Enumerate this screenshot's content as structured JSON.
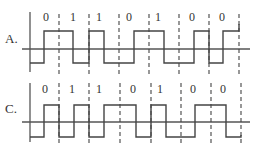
{
  "diagrams": [
    {
      "id": "A",
      "label": "A.",
      "bits": [
        "0",
        "1",
        "1",
        "0",
        "1",
        "0",
        "0"
      ],
      "geometry": {
        "label_x": 5,
        "label_y": 43,
        "axis_x": 30,
        "axis_top": 12,
        "axis_bottom": 72,
        "baseline_y": 49,
        "baseline_x1": 22,
        "baseline_x2": 250,
        "high_y": 31,
        "low_y": 63,
        "digit_y": 21,
        "dash_top": 14,
        "dash_bottom": 75
      },
      "dash_x": [
        59,
        89,
        119,
        149,
        179,
        209,
        239
      ],
      "digit_x": [
        46,
        73,
        99,
        129,
        158,
        192,
        222
      ],
      "waveform": [
        [
          30,
          "L"
        ],
        [
          44,
          "H"
        ],
        [
          73,
          "L"
        ],
        [
          89,
          "H"
        ],
        [
          104,
          "L"
        ],
        [
          134,
          "H"
        ],
        [
          164,
          "L"
        ],
        [
          194,
          "H"
        ],
        [
          209,
          "L"
        ],
        [
          223,
          "H"
        ],
        [
          239,
          "T"
        ]
      ],
      "end_tick_y": 24
    },
    {
      "id": "C",
      "label": "C.",
      "bits": [
        "0",
        "1",
        "1",
        "0",
        "1",
        "0",
        "0"
      ],
      "geometry": {
        "label_x": 5,
        "label_y": 113,
        "axis_x": 30,
        "axis_top": 83,
        "axis_bottom": 142,
        "baseline_y": 122,
        "baseline_x1": 22,
        "baseline_x2": 250,
        "high_y": 105,
        "low_y": 137,
        "digit_y": 93,
        "dash_top": 83,
        "dash_bottom": 143
      },
      "dash_x": [
        59,
        89,
        120,
        151,
        181,
        211,
        241
      ],
      "digit_x": [
        45,
        72,
        99,
        133,
        160,
        193,
        223
      ],
      "waveform": [
        [
          30,
          "L"
        ],
        [
          44,
          "H"
        ],
        [
          59,
          "L"
        ],
        [
          74,
          "H"
        ],
        [
          89,
          "L"
        ],
        [
          104,
          "H"
        ],
        [
          136,
          "L"
        ],
        [
          151,
          "H"
        ],
        [
          166,
          "L"
        ],
        [
          195,
          "H"
        ],
        [
          226,
          "L"
        ],
        [
          241,
          "T"
        ]
      ],
      "end_tick_y": 135
    }
  ]
}
